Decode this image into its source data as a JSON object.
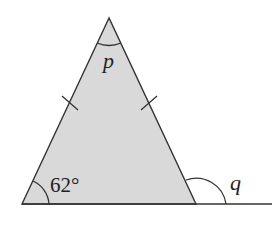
{
  "diagram": {
    "type": "isosceles-triangle",
    "fill_color": "#d9d9d9",
    "stroke_color": "#333333",
    "labels": {
      "apex_angle": "p",
      "base_angle": "62°",
      "exterior_angle": "q"
    },
    "equal_sides_marked": true
  }
}
